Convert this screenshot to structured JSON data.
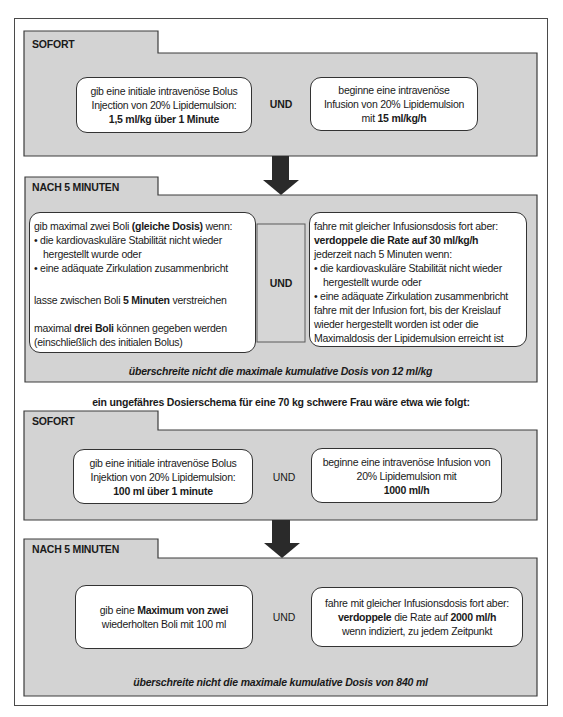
{
  "sections": [
    {
      "tab_label": "SOFORT",
      "left_box": {
        "lines": [
          {
            "segments": [
              {
                "text": "gib eine initiale intravenöse Bolus",
                "bold": false
              }
            ]
          },
          {
            "segments": [
              {
                "text": "Injection von 20% Lipidemulsion:",
                "bold": false
              }
            ]
          },
          {
            "segments": [
              {
                "text": "1,5 ml/kg über 1 Minute",
                "bold": true
              }
            ]
          }
        ]
      },
      "connector": "UND",
      "right_box": {
        "lines": [
          {
            "segments": [
              {
                "text": "beginne eine intravenöse",
                "bold": false
              }
            ]
          },
          {
            "segments": [
              {
                "text": "Infusion von 20% Lipidemulsion",
                "bold": false
              }
            ]
          },
          {
            "segments": [
              {
                "text": "mit ",
                "bold": false
              },
              {
                "text": "15 ml/kg/h",
                "bold": true
              }
            ]
          }
        ]
      }
    },
    {
      "tab_label": "NACH 5 MINUTEN",
      "left_box": {
        "lines": [
          {
            "segments": [
              {
                "text": "gib maximal zwei Boli ",
                "bold": false
              },
              {
                "text": "(gleiche Dosis)",
                "bold": true
              },
              {
                "text": " wenn:",
                "bold": false
              }
            ]
          },
          {
            "segments": [
              {
                "text": "• die kardiovaskuläre Stabilität nicht wieder",
                "bold": false
              }
            ]
          },
          {
            "indent": true,
            "segments": [
              {
                "text": "hergestellt wurde oder",
                "bold": false
              }
            ]
          },
          {
            "segments": [
              {
                "text": "• eine adäquate Zirkulation zusammenbricht",
                "bold": false
              }
            ]
          },
          {
            "segments": []
          },
          {
            "segments": [
              {
                "text": "lasse zwischen Boli ",
                "bold": false
              },
              {
                "text": "5 Minuten",
                "bold": true
              },
              {
                "text": " verstreichen",
                "bold": false
              }
            ]
          },
          {
            "segments": []
          },
          {
            "segments": [
              {
                "text": "maximal ",
                "bold": false
              },
              {
                "text": "drei Boli",
                "bold": true
              },
              {
                "text": " können gegeben werden",
                "bold": false
              }
            ]
          },
          {
            "segments": [
              {
                "text": "(einschließlich des initialen Bolus)",
                "bold": false
              }
            ]
          }
        ]
      },
      "connector": "UND",
      "right_box": {
        "lines": [
          {
            "segments": [
              {
                "text": "fahre mit gleicher Infusionsdosis fort aber:",
                "bold": false
              }
            ]
          },
          {
            "segments": [
              {
                "text": "verdoppele die Rate auf 30 ml/kg/h",
                "bold": true
              }
            ]
          },
          {
            "segments": [
              {
                "text": "jederzeit nach 5 Minuten wenn:",
                "bold": false
              }
            ]
          },
          {
            "segments": [
              {
                "text": "• die kardiovaskuläre Stabilität nicht wieder",
                "bold": false
              }
            ]
          },
          {
            "indent": true,
            "segments": [
              {
                "text": "hergestellt wurde oder",
                "bold": false
              }
            ]
          },
          {
            "segments": [
              {
                "text": "• eine adäquate Zirkulation zusammenbricht",
                "bold": false
              }
            ]
          },
          {
            "segments": [
              {
                "text": "fahre mit der Infusion fort, bis der Kreislauf",
                "bold": false
              }
            ]
          },
          {
            "segments": [
              {
                "text": "wieder hergestellt worden ist oder die",
                "bold": false
              }
            ]
          },
          {
            "segments": [
              {
                "text": "Maximaldosis der Lipidemulsion erreicht ist",
                "bold": false
              }
            ]
          }
        ]
      },
      "footer_note": "überschreite nicht die maximale kumulative Dosis von 12 ml/kg"
    },
    {
      "tab_label": "SOFORT",
      "left_box": {
        "lines": [
          {
            "segments": [
              {
                "text": "gib eine initiale intravenöse Bolus",
                "bold": false
              }
            ]
          },
          {
            "segments": [
              {
                "text": "Injektion von 20% Lipidemulsion:",
                "bold": false
              }
            ]
          },
          {
            "segments": [
              {
                "text": "100 ml über 1 minute",
                "bold": true
              }
            ]
          }
        ]
      },
      "connector": "UND",
      "right_box": {
        "lines": [
          {
            "segments": [
              {
                "text": "beginne eine intravenöse Infusion von",
                "bold": false
              }
            ]
          },
          {
            "segments": [
              {
                "text": "20% Lipidemulsion mit",
                "bold": false
              }
            ]
          },
          {
            "segments": [
              {
                "text": "1000 ml/h",
                "bold": true
              }
            ]
          }
        ]
      }
    },
    {
      "tab_label": "NACH 5 MINUTEN",
      "left_box": {
        "lines": [
          {
            "segments": [
              {
                "text": "gib eine ",
                "bold": false
              },
              {
                "text": "Maximum von zwei",
                "bold": true
              }
            ]
          },
          {
            "segments": [
              {
                "text": "wiederholten Boli mit 100 ml",
                "bold": false
              }
            ]
          }
        ]
      },
      "connector": "UND",
      "right_box": {
        "lines": [
          {
            "segments": [
              {
                "text": "fahre mit gleicher Infusionsdosis fort aber:",
                "bold": false
              }
            ]
          },
          {
            "segments": [
              {
                "text": "verdoppele",
                "bold": true
              },
              {
                "text": " die Rate auf ",
                "bold": false
              },
              {
                "text": "2000 ml/h",
                "bold": true
              }
            ]
          },
          {
            "segments": [
              {
                "text": "wenn indiziert, zu jedem Zeitpunkt",
                "bold": false
              }
            ]
          }
        ]
      },
      "footer_note": "überschreite nicht die maximale kumulative Dosis von 840 ml"
    }
  ],
  "example_intro": "ein ungefähres Dosierschema für eine 70 kg schwere Frau wäre etwa wie folgt:",
  "colors": {
    "panel_fill": "#d3d3d3",
    "panel_stroke": "#3c3c3c",
    "arrow": "#2a2a2a",
    "box_fill": "#ffffff"
  }
}
